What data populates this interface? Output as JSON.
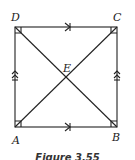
{
  "figure": {
    "caption": "Figure 3.55",
    "vertices": {
      "A": "A",
      "B": "B",
      "C": "C",
      "D": "D",
      "E": "E"
    },
    "shape": "square ABCD with diagonals AC and BD intersecting at E",
    "markings": {
      "parallel_single": [
        "DC",
        "AB"
      ],
      "parallel_double": [
        "AD",
        "BC"
      ],
      "right_angles": [
        "A",
        "B",
        "C",
        "D"
      ]
    },
    "stroke_color": "#222222"
  }
}
